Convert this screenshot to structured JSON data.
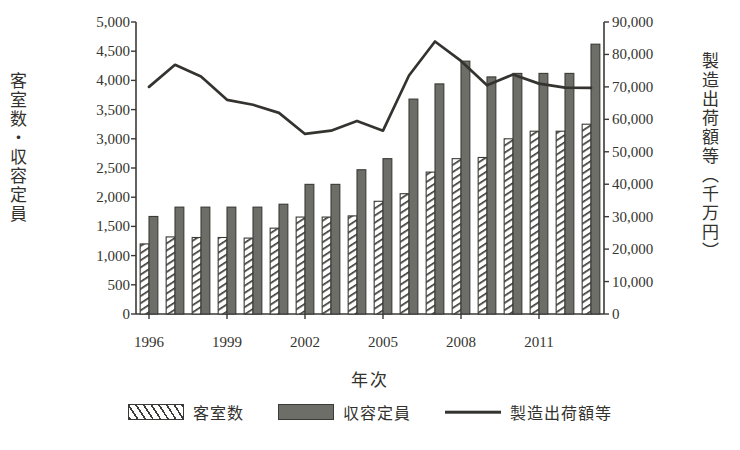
{
  "chart_data": {
    "type": "bar",
    "title": "",
    "xlabel": "年次",
    "ylabel": "客室数・収容定員",
    "y2label": "製造出荷額等（千万円）",
    "grid": false,
    "legend_position": "bottom",
    "categories": [
      1996,
      1997,
      1998,
      1999,
      2000,
      2001,
      2002,
      2003,
      2004,
      2005,
      2006,
      2007,
      2008,
      2009,
      2010,
      2011,
      2012,
      2013
    ],
    "x_tick_labels": [
      "1996",
      "1999",
      "2002",
      "2005",
      "2008",
      "2011"
    ],
    "x_tick_values": [
      1996,
      1999,
      2002,
      2005,
      2008,
      2011
    ],
    "ylim": [
      0,
      5000
    ],
    "y_ticks": [
      0,
      500,
      1000,
      1500,
      2000,
      2500,
      3000,
      3500,
      4000,
      4500,
      5000
    ],
    "y_tick_labels": [
      "0",
      "500",
      "1,000",
      "1,500",
      "2,000",
      "2,500",
      "3,000",
      "3,500",
      "4,000",
      "4,500",
      "5,000"
    ],
    "y2lim": [
      0,
      90000
    ],
    "y2_ticks": [
      0,
      10000,
      20000,
      30000,
      40000,
      50000,
      60000,
      70000,
      80000,
      90000
    ],
    "y2_tick_labels": [
      "0",
      "10,000",
      "20,000",
      "30,000",
      "40,000",
      "50,000",
      "60,000",
      "70,000",
      "80,000",
      "90,000"
    ],
    "series": [
      {
        "name": "客室数",
        "type": "bar",
        "axis": "left",
        "fill": "diagonal-hatch",
        "values": [
          1200,
          1320,
          1310,
          1310,
          1300,
          1470,
          1660,
          1660,
          1680,
          1930,
          2060,
          2430,
          2660,
          2680,
          3000,
          3130,
          3130,
          3250
        ]
      },
      {
        "name": "収容定員",
        "type": "bar",
        "axis": "left",
        "fill": "solid-gray",
        "values": [
          1670,
          1830,
          1830,
          1830,
          1830,
          1880,
          2220,
          2220,
          2470,
          2660,
          3680,
          3940,
          4330,
          4060,
          4120,
          4120,
          4120,
          4620
        ]
      },
      {
        "name": "製造出荷額等",
        "type": "line",
        "axis": "right",
        "values": [
          70000,
          76800,
          73200,
          66000,
          64500,
          62000,
          55500,
          56500,
          59500,
          56500,
          73500,
          84000,
          78000,
          70500,
          73800,
          71000,
          69800,
          69700
        ]
      }
    ]
  },
  "legend": {
    "items": [
      {
        "label": "客室数",
        "swatch": "hatch"
      },
      {
        "label": "収容定員",
        "swatch": "solid"
      },
      {
        "label": "製造出荷額等",
        "swatch": "line"
      }
    ]
  }
}
